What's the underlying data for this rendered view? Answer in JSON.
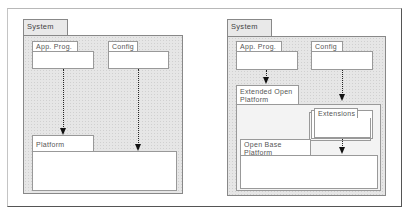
{
  "left_diagram": {
    "system_label": "System",
    "app_prog_label": "App. Prog.",
    "config_label": "Config",
    "platform_label": "Platform"
  },
  "right_diagram": {
    "system_label": "System",
    "app_prog_label": "App. Prog.",
    "config_label": "Config",
    "extended_platform_label": "Extended Open Platform",
    "extensions_label": "Extensions",
    "base_platform_label": "Open Base Platform"
  },
  "colors": {
    "system_fill": "#e6e6e6",
    "border": "#888888",
    "arrow": "#111111"
  }
}
